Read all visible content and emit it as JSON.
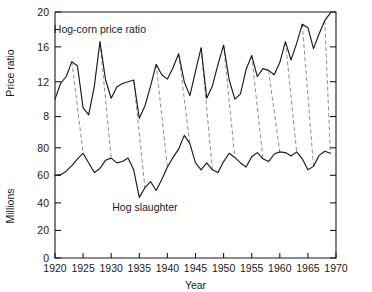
{
  "chart_data": {
    "type": "line",
    "title": "",
    "xlabel": "Year",
    "axes": {
      "x": {
        "label": "Year",
        "min": 1920,
        "max": 1970,
        "ticks": [
          1920,
          1925,
          1930,
          1935,
          1940,
          1945,
          1950,
          1955,
          1960,
          1965,
          1970
        ],
        "tick_labels": [
          "1920",
          "1925",
          "1930",
          "1935",
          "1940",
          "1945",
          "1950",
          "1955",
          "1960",
          "1965",
          "1970"
        ]
      },
      "y_upper": {
        "label": "Price ratio",
        "min": 6,
        "max": 20,
        "ticks": [
          8,
          12,
          16,
          20
        ],
        "tick_labels": [
          "8",
          "12",
          "16",
          "20"
        ]
      },
      "y_lower": {
        "label": "Millions",
        "min": 0,
        "max": 90,
        "ticks": [
          0,
          20,
          40,
          60,
          80
        ],
        "tick_labels": [
          "0",
          "20",
          "40",
          "60",
          "80"
        ]
      },
      "grid": false,
      "legend_position": "inline-annotation"
    },
    "series": [
      {
        "name": "Hog-corn price ratio",
        "annotation": "Hog-corn price ratio",
        "axis": "y_upper",
        "units": "ratio",
        "x": [
          1920,
          1921,
          1922,
          1923,
          1924,
          1925,
          1926,
          1927,
          1928,
          1929,
          1930,
          1931,
          1932,
          1933,
          1934,
          1935,
          1936,
          1937,
          1938,
          1939,
          1940,
          1941,
          1942,
          1943,
          1944,
          1945,
          1946,
          1947,
          1948,
          1949,
          1950,
          1951,
          1952,
          1953,
          1954,
          1955,
          1956,
          1957,
          1958,
          1959,
          1960,
          1961,
          1962,
          1963,
          1964,
          1965,
          1966,
          1967,
          1968,
          1969
        ],
        "values": [
          10.0,
          11.8,
          12.6,
          14.3,
          13.8,
          9.0,
          8.2,
          11.5,
          16.6,
          12.2,
          10.1,
          11.4,
          11.8,
          12.0,
          12.2,
          7.8,
          9.2,
          11.5,
          14.0,
          12.8,
          12.3,
          13.6,
          15.2,
          12.0,
          10.4,
          13.2,
          15.9,
          10.1,
          11.5,
          14.0,
          16.2,
          12.2,
          10.0,
          10.6,
          13.4,
          15.0,
          12.6,
          13.5,
          13.3,
          12.8,
          14.2,
          16.6,
          14.5,
          16.4,
          18.6,
          18.2,
          15.8,
          17.5,
          19.0,
          19.9
        ]
      },
      {
        "name": "Hog slaughter",
        "annotation": "Hog slaughter",
        "axis": "y_lower",
        "units": "millions of head",
        "x": [
          1920,
          1921,
          1922,
          1923,
          1924,
          1925,
          1926,
          1927,
          1928,
          1929,
          1930,
          1931,
          1932,
          1933,
          1934,
          1935,
          1936,
          1937,
          1938,
          1939,
          1940,
          1941,
          1942,
          1943,
          1944,
          1945,
          1946,
          1947,
          1948,
          1949,
          1950,
          1951,
          1952,
          1953,
          1954,
          1955,
          1956,
          1957,
          1958,
          1959,
          1960,
          1961,
          1962,
          1963,
          1964,
          1965,
          1966,
          1967,
          1968,
          1969
        ],
        "values": [
          60.0,
          60.5,
          63.0,
          67.0,
          72.0,
          76.0,
          69.0,
          62.0,
          65.0,
          71.0,
          72.5,
          69.0,
          70.0,
          72.5,
          64.0,
          44.0,
          51.0,
          55.5,
          49.0,
          57.0,
          66.0,
          73.0,
          79.0,
          89.0,
          83.0,
          69.0,
          64.0,
          69.0,
          64.0,
          62.0,
          70.0,
          76.0,
          73.0,
          69.0,
          66.0,
          73.5,
          76.5,
          72.0,
          70.0,
          75.5,
          77.0,
          76.5,
          74.0,
          77.0,
          72.0,
          64.0,
          66.5,
          74.5,
          77.5,
          76.0
        ]
      }
    ],
    "annotations": [
      {
        "text": "Hog-corn price ratio",
        "x": 1928,
        "y": 17.6,
        "series": "Hog-corn price ratio"
      },
      {
        "text": "Hog slaughter",
        "x": 1936,
        "y": 34,
        "series": "Hog slaughter"
      }
    ],
    "lag_connectors": {
      "description": "Dashed lines linking each hog-corn price ratio peak to the hog slaughter peak of the following year",
      "pairs": [
        {
          "from_year": 1923,
          "to_year": 1925
        },
        {
          "from_year": 1928,
          "to_year": 1930
        },
        {
          "from_year": 1934,
          "to_year": 1936
        },
        {
          "from_year": 1938,
          "to_year": 1940
        },
        {
          "from_year": 1942,
          "to_year": 1944
        },
        {
          "from_year": 1946,
          "to_year": 1948
        },
        {
          "from_year": 1950,
          "to_year": 1952
        },
        {
          "from_year": 1955,
          "to_year": 1957
        },
        {
          "from_year": 1958,
          "to_year": 1960
        },
        {
          "from_year": 1961,
          "to_year": 1963
        },
        {
          "from_year": 1964,
          "to_year": 1966
        },
        {
          "from_year": 1968,
          "to_year": 1969
        }
      ]
    },
    "colors": {
      "line": "#1a1a1a",
      "connector": "#7a7a7a",
      "axis": "#1a1a1a",
      "background": "#ffffff"
    }
  },
  "labels": {
    "y_upper_title": "Price ratio",
    "y_lower_title": "Millions",
    "x_title": "Year",
    "upper_series": "Hog-corn price ratio",
    "lower_series": "Hog slaughter"
  }
}
